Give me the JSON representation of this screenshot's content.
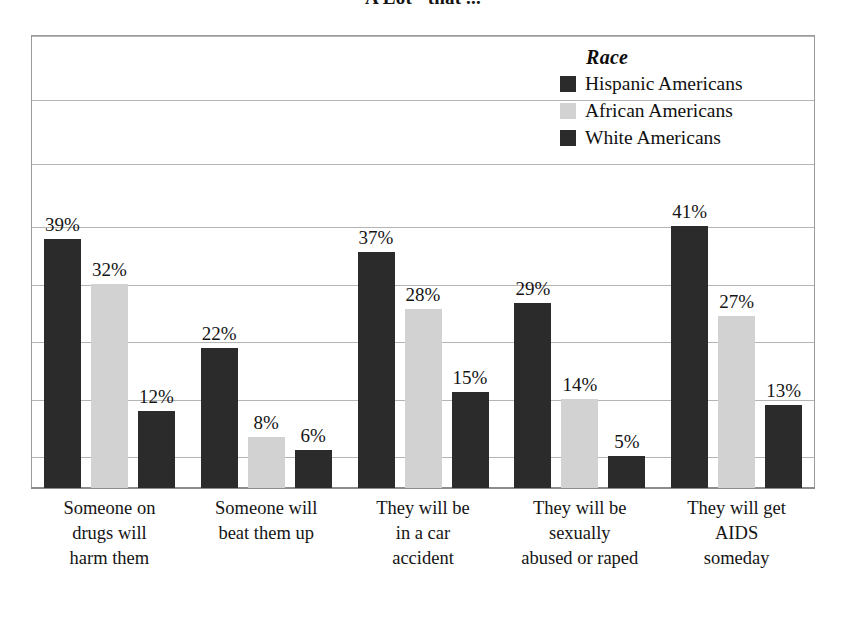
{
  "title": "A Lot\" that ...",
  "legend": {
    "title": "Race",
    "entries": [
      {
        "label": "Hispanic Americans",
        "color": "#2b2b2b"
      },
      {
        "label": "African Americans",
        "color": "#d2d2d2"
      },
      {
        "label": "White Americans",
        "color": "#2b2b2b"
      }
    ]
  },
  "chart_data": {
    "type": "bar",
    "title": "A Lot\" that ...",
    "xlabel": "",
    "ylabel": "",
    "ylim": [
      0,
      71
    ],
    "grid": true,
    "legend_position": "top-right",
    "legend_title": "Race",
    "value_suffix": "%",
    "categories": [
      "Someone on drugs will harm them",
      "Someone will beat them up",
      "They will be in a car accident",
      "They will be sexually abused or raped",
      "They will get AIDS someday"
    ],
    "category_lines": [
      [
        "Someone on",
        "drugs will",
        "harm them"
      ],
      [
        "Someone will",
        "beat them up"
      ],
      [
        "They will be",
        "in a car",
        "accident"
      ],
      [
        "They will be",
        "sexually",
        "abused or raped"
      ],
      [
        "They will get",
        "AIDS",
        "someday"
      ]
    ],
    "series": [
      {
        "name": "Hispanic Americans",
        "color": "#2b2b2b",
        "values": [
          39,
          22,
          37,
          29,
          41
        ]
      },
      {
        "name": "African Americans",
        "color": "#d2d2d2",
        "values": [
          32,
          8,
          28,
          14,
          27
        ]
      },
      {
        "name": "White Americans",
        "color": "#2b2b2b",
        "values": [
          12,
          6,
          15,
          5,
          13
        ]
      }
    ],
    "data_labels": [
      [
        "39%",
        "32%",
        "12%"
      ],
      [
        "22%",
        "8%",
        "6%"
      ],
      [
        "37%",
        "28%",
        "15%"
      ],
      [
        "29%",
        "14%",
        "5%"
      ],
      [
        "41%",
        "27%",
        "13%"
      ]
    ],
    "gridline_values": [
      71,
      61,
      51,
      41,
      32,
      23,
      14,
      5
    ]
  },
  "colors": {
    "dark_bar": "#2b2b2b",
    "light_bar": "#d2d2d2",
    "gridline": "#b4b4b4",
    "frame": "#9a9a9a",
    "text": "#141414",
    "background": "#ffffff"
  }
}
